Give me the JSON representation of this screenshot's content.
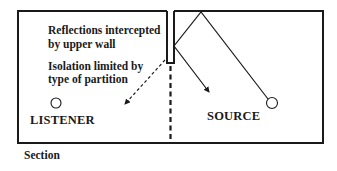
{
  "diagram": {
    "type": "acoustic section",
    "annotations": {
      "reflections_line1": "Reflections intercepted",
      "reflections_line2": "by upper wall",
      "isolation_line1": "Isolation limited by",
      "isolation_line2": "type of partition"
    },
    "rooms": {
      "left_label": "LISTENER",
      "right_label": "SOURCE"
    },
    "caption": "Section",
    "colors": {
      "ink": "#1a1a1a",
      "background": "#ffffff"
    }
  }
}
